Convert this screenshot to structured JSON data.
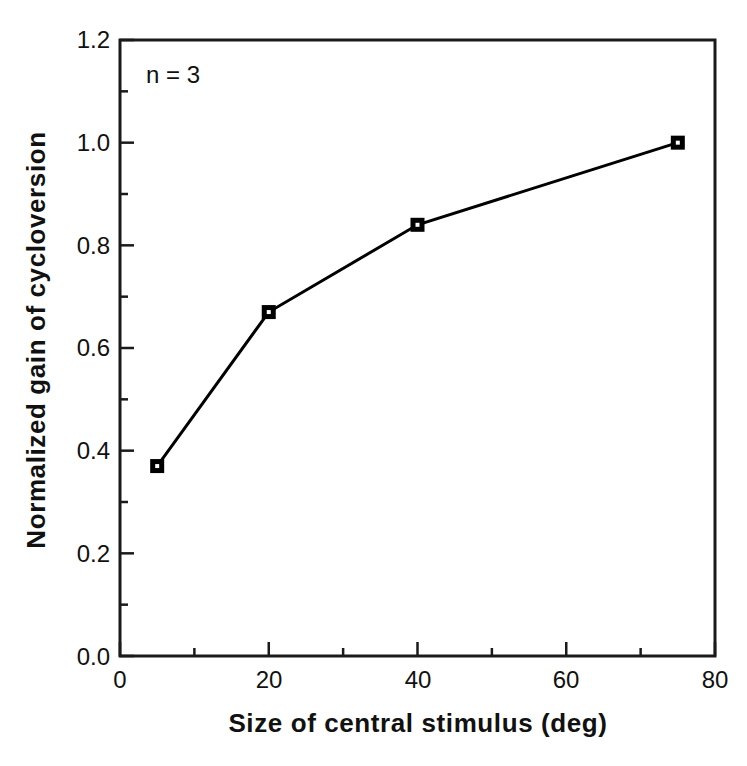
{
  "chart_data": {
    "type": "line",
    "title": "",
    "xlabel": "Size of central stimulus (deg)",
    "ylabel": "Normalized gain of cycloversion",
    "xlim": [
      0,
      80
    ],
    "ylim": [
      0.0,
      1.2
    ],
    "grid": false,
    "legend": null,
    "annotations": [
      {
        "text": "n = 3",
        "x": 5,
        "y": 1.13
      }
    ],
    "xticks": [
      0,
      20,
      40,
      60,
      80
    ],
    "xtick_labels": [
      "0",
      "20",
      "40",
      "60",
      "80"
    ],
    "xminor_ticks": [
      10,
      30,
      50,
      70
    ],
    "yticks": [
      0.0,
      0.2,
      0.4,
      0.6,
      0.8,
      1.0,
      1.2
    ],
    "ytick_labels": [
      "0.0",
      "0.2",
      "0.4",
      "0.6",
      "0.8",
      "1.0",
      "1.2"
    ],
    "yminor_ticks": [
      0.1,
      0.3,
      0.5,
      0.7,
      0.9,
      1.1
    ],
    "series": [
      {
        "name": "Normalized gain of cycloversion",
        "marker": "square",
        "color": "#000000",
        "x": [
          5,
          20,
          40,
          75
        ],
        "y": [
          0.37,
          0.67,
          0.84,
          1.0
        ]
      }
    ]
  },
  "annotation": {
    "n_label": "n = 3"
  },
  "axes": {
    "x_title": "Size of central stimulus (deg)",
    "y_title": "Normalized gain of cycloversion",
    "x_labels": [
      "0",
      "20",
      "40",
      "60",
      "80"
    ],
    "y_labels": [
      "0.0",
      "0.2",
      "0.4",
      "0.6",
      "0.8",
      "1.0",
      "1.2"
    ]
  },
  "colors": {
    "line": "#000000",
    "axis": "#1a1a1a",
    "background": "#ffffff"
  }
}
